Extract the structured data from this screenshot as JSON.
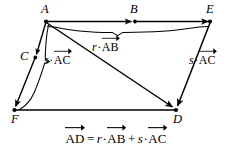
{
  "figure": {
    "kind": "vector-parallelogram-diagram",
    "width": 232,
    "height": 161,
    "background_color": "#ffffff",
    "ink_color": "#000000"
  },
  "points": {
    "A": {
      "label": "A",
      "x": 46,
      "y": 21
    },
    "B": {
      "label": "B",
      "x": 134,
      "y": 21
    },
    "C": {
      "label": "C",
      "x": 35,
      "y": 58
    },
    "D": {
      "label": "D",
      "x": 176,
      "y": 110
    },
    "E": {
      "label": "E",
      "x": 210,
      "y": 21
    },
    "F": {
      "label": "F",
      "x": 14,
      "y": 110
    }
  },
  "labels": {
    "r_AB": {
      "scalar": "r",
      "dot": "·",
      "vector": "AB"
    },
    "s_AC_left": {
      "scalar": "s",
      "dot": "·",
      "vector": "AC"
    },
    "s_AC_right": {
      "scalar": "s",
      "dot": "·",
      "vector": "AC"
    }
  },
  "equation": {
    "lhs_vector": "AD",
    "equals": "=",
    "term1_scalar": "r",
    "term1_dot": "·",
    "term1_vector": "AB",
    "plus": "+",
    "term2_scalar": "s",
    "term2_dot": "·",
    "term2_vector": "AC",
    "plain_text": "AD = r·AB + s·AC"
  },
  "vectors": [
    {
      "name": "A-to-E",
      "from": "A",
      "to": "E",
      "passes_through": "B",
      "arrowheads_at": [
        "B",
        "E"
      ]
    },
    {
      "name": "A-to-F",
      "from": "A",
      "to": "F",
      "passes_through": "C",
      "arrowheads_at": [
        "C",
        "F"
      ]
    },
    {
      "name": "A-to-D",
      "from": "A",
      "to": "D",
      "arrowheads_at": [
        "D"
      ]
    },
    {
      "name": "E-to-D",
      "from": "E",
      "to": "D",
      "arrowheads_at": [
        "D"
      ]
    },
    {
      "name": "F-to-D",
      "from": "F",
      "to": "D",
      "arrowheads_at": []
    }
  ],
  "braces": [
    {
      "name": "brace-r-AB",
      "spans": "A-to-E",
      "label_key": "r_AB",
      "orientation": "below-horizontal"
    },
    {
      "name": "brace-s-AC",
      "spans": "A-to-F",
      "label_key": "s_AC_left",
      "orientation": "right-of-vertical"
    }
  ]
}
